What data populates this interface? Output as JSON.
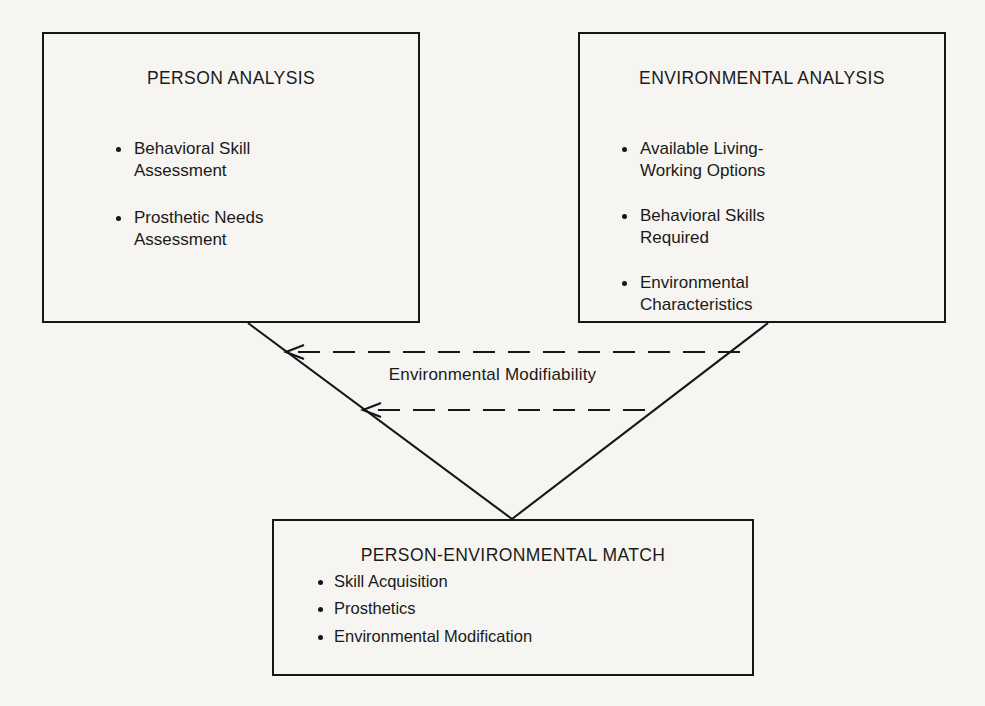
{
  "diagram": {
    "title": "Person-Environmental Match",
    "background_color": "#f6f5f1",
    "line_color": "#16161a",
    "text_color": "#1a1a1a",
    "nodes": [
      {
        "id": "person-analysis",
        "title": "PERSON ANALYSIS",
        "items": [
          "Behavioral Skill\nAssessment",
          "Prosthetic Needs\nAssessment"
        ]
      },
      {
        "id": "environmental-analysis",
        "title": "ENVIRONMENTAL ANALYSIS",
        "items": [
          "Available Living-\nWorking Options",
          "Behavioral Skills\nRequired",
          "Environmental\nCharacteristics"
        ]
      },
      {
        "id": "person-environmental-match",
        "title": "PERSON-ENVIRONMENTAL MATCH",
        "items": [
          "Skill Acquisition",
          "Prosthetics",
          "Environmental Modification"
        ]
      }
    ],
    "edges": [
      {
        "id": "person-to-match",
        "style": "solid",
        "from": "person-analysis",
        "to": "person-environmental-match"
      },
      {
        "id": "environment-to-match",
        "style": "solid",
        "from": "environmental-analysis",
        "to": "person-environmental-match"
      },
      {
        "id": "modifiability-upper",
        "style": "dashed",
        "arrow": "left"
      },
      {
        "id": "modifiability-lower",
        "style": "dashed",
        "arrow": "left"
      }
    ],
    "edge_labels": [
      {
        "id": "environmental-modifiability",
        "text": "Environmental Modifiability"
      }
    ]
  }
}
